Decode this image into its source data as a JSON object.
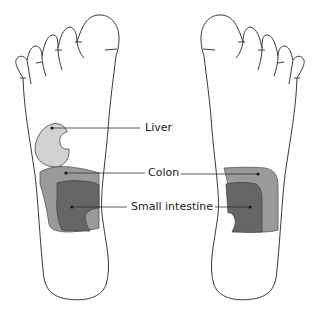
{
  "diagram": {
    "type": "foot-reflexology-map",
    "feet": [
      "left-sole",
      "right-sole"
    ],
    "labels": {
      "liver": "Liver",
      "colon": "Colon",
      "small_intestine": "Small intestine"
    },
    "colors": {
      "outline": "#3a3a3a",
      "liver": "#d2d2d2",
      "colon": "#9a9a9a",
      "small_intestine": "#666666",
      "leader_line": "#333333"
    }
  }
}
